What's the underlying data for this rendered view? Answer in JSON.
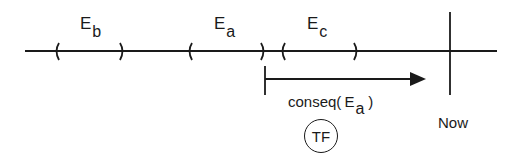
{
  "diagram": {
    "type": "timeline",
    "events": [
      {
        "id": "Eb",
        "label_main": "E",
        "label_sub": "b",
        "interval": "( )"
      },
      {
        "id": "Ea",
        "label_main": "E",
        "label_sub": "a",
        "interval": "( )"
      },
      {
        "id": "Ec",
        "label_main": "E",
        "label_sub": "c",
        "interval": "( )"
      }
    ],
    "arrow": {
      "label_prefix": "conseq(",
      "label_main": "E",
      "label_sub": "a",
      "label_suffix": ")"
    },
    "badge": {
      "label": "TF"
    },
    "now": {
      "label": "Now"
    },
    "colors": {
      "ink": "#1a1a1a",
      "background": "#ffffff"
    }
  }
}
